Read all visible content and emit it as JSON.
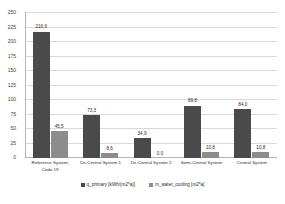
{
  "chart_data": {
    "type": "bar",
    "title": "",
    "xlabel": "",
    "ylabel": "",
    "ylim": [
      0,
      250
    ],
    "ytick_step": 25,
    "yticks": [
      "250",
      "225",
      "200",
      "175",
      "150",
      "125",
      "100",
      "75",
      "50",
      "25",
      "0"
    ],
    "grid": true,
    "legend_position": "bottom",
    "categories": [
      "Reference System, Code 19",
      "De-Central System 1",
      "De-Central System 2",
      "Semi-Central System",
      "Central System"
    ],
    "series": [
      {
        "name": "q_primary [kWh/(m2*a)]",
        "color": "#4a4a4a",
        "values": [
          216.6,
          73.3,
          34.9,
          89.8,
          84.0
        ],
        "labels": [
          "216,6",
          "73,3",
          "34,9",
          "89,8",
          "84,0"
        ]
      },
      {
        "name": "m_water_cooling [m2*a]",
        "color": "#8c8c8c",
        "values": [
          45.5,
          8.6,
          0.0,
          10.8,
          10.8
        ],
        "labels": [
          "45,5",
          "8,6",
          "0,0",
          "10,8",
          "10,8"
        ]
      }
    ]
  },
  "legend": {
    "items": [
      {
        "label": "q_primary [kWh/(m2*a)]"
      },
      {
        "label": "m_water_cooling [m2*a]"
      }
    ]
  }
}
